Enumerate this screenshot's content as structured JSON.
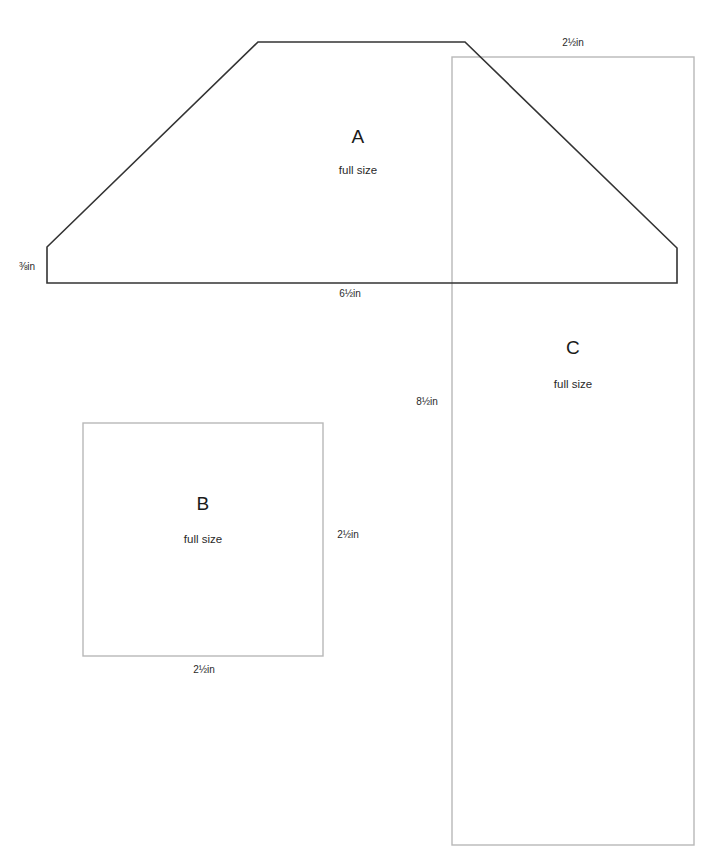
{
  "sheet": {
    "width": 717,
    "height": 859,
    "background": "#ffffff",
    "stroke_dark": "#333333",
    "stroke_light": "#b8b8b8"
  },
  "pieces": [
    {
      "id": "A",
      "letter": "A",
      "scale_note": "full size",
      "shape": "trapezoid",
      "letter_x": 358,
      "letter_y": 127,
      "scale_x": 358,
      "scale_y": 165,
      "outline": "47,247 258,42 465,42 677,248 677,283 47,283",
      "stroke": "#333333",
      "stroke_width": 1.6
    },
    {
      "id": "B",
      "letter": "B",
      "scale_note": "full size",
      "shape": "rectangle",
      "letter_x": 203,
      "letter_y": 494,
      "scale_x": 203,
      "scale_y": 534,
      "x": 83,
      "y": 423,
      "width": 240,
      "height": 233,
      "stroke": "#b8b8b8",
      "stroke_width": 1.4
    },
    {
      "id": "C",
      "letter": "C",
      "scale_note": "full size",
      "shape": "rectangle",
      "letter_x": 573,
      "letter_y": 338,
      "scale_x": 573,
      "scale_y": 379,
      "x": 452,
      "y": 57,
      "width": 242,
      "height": 788,
      "stroke": "#b8b8b8",
      "stroke_width": 1.4
    }
  ],
  "dimensions": [
    {
      "name": "piece-a-left-height",
      "text": "⅛in",
      "display": "⅜in",
      "x": 27,
      "y": 262
    },
    {
      "name": "piece-a-bottom-width",
      "text": "6½in",
      "x": 350,
      "y": 289
    },
    {
      "name": "piece-c-top-width",
      "text": "2½in",
      "x": 573,
      "y": 38
    },
    {
      "name": "piece-c-left-height",
      "text": "8½in",
      "x": 427,
      "y": 397
    },
    {
      "name": "piece-b-right-height",
      "text": "2½in",
      "x": 348,
      "y": 530
    },
    {
      "name": "piece-b-bottom-width",
      "text": "2½in",
      "x": 204,
      "y": 665
    }
  ]
}
